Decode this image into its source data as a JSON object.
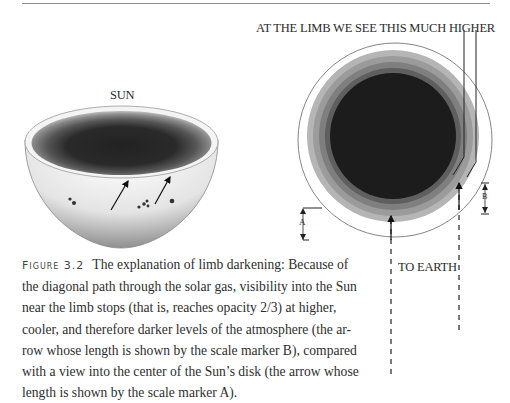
{
  "figure": {
    "number_label": "Figure 3.2",
    "sun_label": "SUN",
    "limb_label": "AT THE LIMB WE SEE THIS MUCH HIGHER",
    "earth_label": "TO EARTH",
    "marker_a": "A",
    "marker_b": "B",
    "colors": {
      "ring_outer": "#a9a9a9",
      "ring_2": "#8e8e8e",
      "ring_3": "#747474",
      "ring_4": "#555555",
      "core": "#1c1c1c",
      "outline": "#6a6a6a"
    }
  },
  "caption": {
    "lines": [
      "The explanation of limb darkening: Because of",
      "the diagonal path through the solar gas, visibility into the Sun",
      "near the limb stops (that is, reaches opacity 2/3) at higher,",
      "cooler, and therefore darker levels of the atmosphere (the ar-",
      "row whose length is shown by the scale marker B), compared",
      "with a view into the center of the Sun’s disk (the arrow whose",
      "length is shown by the scale marker A)."
    ]
  }
}
